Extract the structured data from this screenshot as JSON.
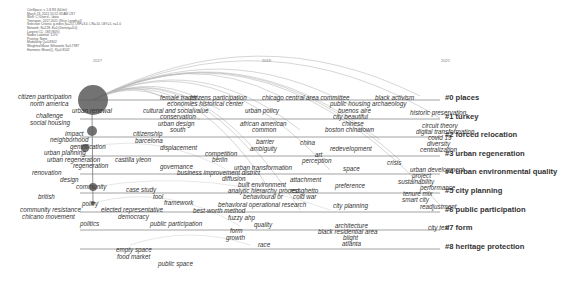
{
  "header_meta": [
    "CiteSpace, v. 5.8.R3 (64-bit)",
    "March 23, 2022 10:51:33 AM CST",
    "WoS: C:\\Users\\...\\data",
    "Timespan: 2017-2021 (Slice Length=1)",
    "Selection Criteria: g-index (k=25), LRF=3.0, L/N=10, LBY=5, e=1.0",
    "Network: N=228, E=0 (Density=0.0)",
    "Largest CC: 183 (80%)",
    "Nodes Labeled: 1.0%",
    "Pruning: None",
    "Modularity Q=0.8302",
    "Weighted Mean Silhouette S=0.7987",
    "Harmonic Mean(Q, S)=0.8142"
  ],
  "years": [
    {
      "label": "2017",
      "x": 93
    },
    {
      "label": "2019",
      "x": 262
    },
    {
      "label": "2021",
      "x": 441
    }
  ],
  "clusters": [
    {
      "id": "#0",
      "label": "#0 places",
      "y": 96
    },
    {
      "id": "#1",
      "label": "#1 turkey",
      "y": 115
    },
    {
      "id": "#2",
      "label": "#2 forced relocation",
      "y": 133
    },
    {
      "id": "#3",
      "label": "#3 urban regeneration",
      "y": 152
    },
    {
      "id": "#4",
      "label": "#4 urban environmental quality",
      "y": 170
    },
    {
      "id": "#5",
      "label": "#5 city planning",
      "y": 189
    },
    {
      "id": "#6",
      "label": "#6 public participation",
      "y": 208
    },
    {
      "id": "#7",
      "label": "#7 form",
      "y": 226
    },
    {
      "id": "#8",
      "label": "#8 heritage protection",
      "y": 245
    }
  ],
  "keywords": [
    {
      "t": "citizen participation",
      "x": 18,
      "y": 97
    },
    {
      "t": "north america",
      "x": 30,
      "y": 104
    },
    {
      "t": "urban renewal",
      "x": 72,
      "y": 111
    },
    {
      "t": "challenge",
      "x": 36,
      "y": 116
    },
    {
      "t": "social housing",
      "x": 30,
      "y": 123
    },
    {
      "t": "impact",
      "x": 65,
      "y": 134
    },
    {
      "t": "neighborhood",
      "x": 50,
      "y": 140
    },
    {
      "t": "gentrification",
      "x": 70,
      "y": 147
    },
    {
      "t": "urban planning",
      "x": 44,
      "y": 153
    },
    {
      "t": "urban regeneration",
      "x": 47,
      "y": 160
    },
    {
      "t": "regeneration",
      "x": 73,
      "y": 166
    },
    {
      "t": "renovation",
      "x": 32,
      "y": 173
    },
    {
      "t": "design",
      "x": 60,
      "y": 180
    },
    {
      "t": "community",
      "x": 76,
      "y": 187
    },
    {
      "t": "british",
      "x": 38,
      "y": 197
    },
    {
      "t": "policy",
      "x": 82,
      "y": 204
    },
    {
      "t": "community resistance",
      "x": 20,
      "y": 210
    },
    {
      "t": "chicano movement",
      "x": 22,
      "y": 217
    },
    {
      "t": "politics",
      "x": 80,
      "y": 224
    },
    {
      "t": "female trader",
      "x": 160,
      "y": 98
    },
    {
      "t": "citizens participation",
      "x": 190,
      "y": 98
    },
    {
      "t": "chicago central area committee",
      "x": 262,
      "y": 98
    },
    {
      "t": "black activism",
      "x": 375,
      "y": 98
    },
    {
      "t": "economies historical center",
      "x": 167,
      "y": 104
    },
    {
      "t": "public housing archaeology",
      "x": 330,
      "y": 104
    },
    {
      "t": "cultural and socialvalue",
      "x": 143,
      "y": 111
    },
    {
      "t": "urban policy",
      "x": 245,
      "y": 111
    },
    {
      "t": "buenos aire",
      "x": 338,
      "y": 111
    },
    {
      "t": "historic preservation",
      "x": 410,
      "y": 113
    },
    {
      "t": "conservation",
      "x": 160,
      "y": 117
    },
    {
      "t": "city beautiful",
      "x": 333,
      "y": 117
    },
    {
      "t": "urban design",
      "x": 158,
      "y": 124
    },
    {
      "t": "african american",
      "x": 240,
      "y": 124
    },
    {
      "t": "chinese",
      "x": 342,
      "y": 124
    },
    {
      "t": "south",
      "x": 170,
      "y": 130
    },
    {
      "t": "common",
      "x": 252,
      "y": 130
    },
    {
      "t": "boston chinatown",
      "x": 325,
      "y": 130
    },
    {
      "t": "circuit theory",
      "x": 422,
      "y": 126
    },
    {
      "t": "digital transformation",
      "x": 416,
      "y": 132
    },
    {
      "t": "covid 19",
      "x": 428,
      "y": 138
    },
    {
      "t": "diversity",
      "x": 427,
      "y": 144
    },
    {
      "t": "centralization",
      "x": 420,
      "y": 150
    },
    {
      "t": "citizenship",
      "x": 133,
      "y": 134
    },
    {
      "t": "barcelona",
      "x": 135,
      "y": 141
    },
    {
      "t": "displacement",
      "x": 160,
      "y": 148
    },
    {
      "t": "barrier",
      "x": 256,
      "y": 142
    },
    {
      "t": "china",
      "x": 300,
      "y": 143
    },
    {
      "t": "ambiguity",
      "x": 250,
      "y": 149
    },
    {
      "t": "redevelopment",
      "x": 330,
      "y": 149
    },
    {
      "t": "competition",
      "x": 205,
      "y": 154
    },
    {
      "t": "art",
      "x": 315,
      "y": 155
    },
    {
      "t": "castilla yleon",
      "x": 115,
      "y": 160
    },
    {
      "t": "berlin",
      "x": 212,
      "y": 160
    },
    {
      "t": "perception",
      "x": 302,
      "y": 161
    },
    {
      "t": "crisis",
      "x": 387,
      "y": 163
    },
    {
      "t": "governance",
      "x": 160,
      "y": 167
    },
    {
      "t": "urban transformation",
      "x": 234,
      "y": 168
    },
    {
      "t": "space",
      "x": 343,
      "y": 169
    },
    {
      "t": "urban development",
      "x": 410,
      "y": 170
    },
    {
      "t": "business improvement district",
      "x": 177,
      "y": 173
    },
    {
      "t": "project",
      "x": 412,
      "y": 176
    },
    {
      "t": "diffusion",
      "x": 222,
      "y": 179
    },
    {
      "t": "attachment",
      "x": 290,
      "y": 180
    },
    {
      "t": "sustainability",
      "x": 398,
      "y": 182
    },
    {
      "t": "built environment",
      "x": 238,
      "y": 185
    },
    {
      "t": "preference",
      "x": 335,
      "y": 186
    },
    {
      "t": "performance",
      "x": 420,
      "y": 188
    },
    {
      "t": "case study",
      "x": 126,
      "y": 190
    },
    {
      "t": "analytic hierarchy process",
      "x": 228,
      "y": 191
    },
    {
      "t": "red ghetto",
      "x": 290,
      "y": 191
    },
    {
      "t": "tenure mix",
      "x": 403,
      "y": 194
    },
    {
      "t": "tool",
      "x": 153,
      "y": 197
    },
    {
      "t": "behavioural or",
      "x": 243,
      "y": 197
    },
    {
      "t": "cold war",
      "x": 293,
      "y": 197
    },
    {
      "t": "smart city",
      "x": 402,
      "y": 200
    },
    {
      "t": "framework",
      "x": 164,
      "y": 203
    },
    {
      "t": "behavioral operational research",
      "x": 218,
      "y": 205
    },
    {
      "t": "city planning",
      "x": 333,
      "y": 206
    },
    {
      "t": "readjustment",
      "x": 420,
      "y": 207
    },
    {
      "t": "elected representative",
      "x": 101,
      "y": 210
    },
    {
      "t": "best-worth method",
      "x": 193,
      "y": 211
    },
    {
      "t": "democracy",
      "x": 118,
      "y": 217
    },
    {
      "t": "fuzzy ahp",
      "x": 228,
      "y": 218
    },
    {
      "t": "public participation",
      "x": 150,
      "y": 224
    },
    {
      "t": "quality",
      "x": 254,
      "y": 225
    },
    {
      "t": "architecture",
      "x": 335,
      "y": 226
    },
    {
      "t": "city text",
      "x": 428,
      "y": 228
    },
    {
      "t": "form",
      "x": 230,
      "y": 231
    },
    {
      "t": "black residential area",
      "x": 318,
      "y": 232
    },
    {
      "t": "growth",
      "x": 226,
      "y": 238
    },
    {
      "t": "blight",
      "x": 343,
      "y": 238
    },
    {
      "t": "race",
      "x": 258,
      "y": 245
    },
    {
      "t": "atlanta",
      "x": 342,
      "y": 244
    },
    {
      "t": "empty space",
      "x": 116,
      "y": 250
    },
    {
      "t": "food market",
      "x": 117,
      "y": 257
    },
    {
      "t": "public space",
      "x": 158,
      "y": 264
    }
  ],
  "nodes": [
    {
      "x": 93,
      "y": 100,
      "r": 15
    },
    {
      "x": 92,
      "y": 131,
      "r": 5
    },
    {
      "x": 85,
      "y": 148,
      "r": 4
    },
    {
      "x": 93,
      "y": 187,
      "r": 4
    },
    {
      "x": 93,
      "y": 203,
      "r": 2
    }
  ],
  "colors": {
    "node": "#5a5a5a",
    "line": "#8a8a8a",
    "text": "#333333"
  }
}
